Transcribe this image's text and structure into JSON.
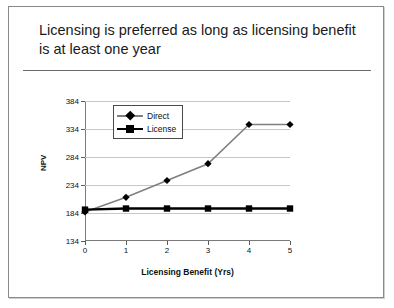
{
  "slide": {
    "title": "Licensing is preferred as long as licensing benefit is at least one year"
  },
  "chart_data": {
    "type": "line",
    "title": "",
    "xlabel": "Licensing Benefit (Yrs)",
    "ylabel": "NPV",
    "x": [
      0,
      1,
      2,
      3,
      4,
      5
    ],
    "xtick_labels": [
      "0",
      "1",
      "2",
      "3",
      "4",
      "5"
    ],
    "ytick_labels": [
      "134",
      "184",
      "234",
      "284",
      "334",
      "384"
    ],
    "ytick_values": [
      134,
      184,
      234,
      284,
      334,
      384
    ],
    "xlim": [
      0,
      5
    ],
    "ylim": [
      134,
      384
    ],
    "grid": true,
    "legend_position": "upper-left-inside",
    "series": [
      {
        "name": "Direct",
        "marker": "diamond",
        "color": "#808080",
        "marker_color": "#000000",
        "values": [
          186,
          212,
          242,
          272,
          342,
          342
        ]
      },
      {
        "name": "License",
        "marker": "square",
        "color": "#000000",
        "marker_color": "#000000",
        "values": [
          190,
          192,
          192,
          192,
          192,
          192
        ]
      }
    ]
  }
}
